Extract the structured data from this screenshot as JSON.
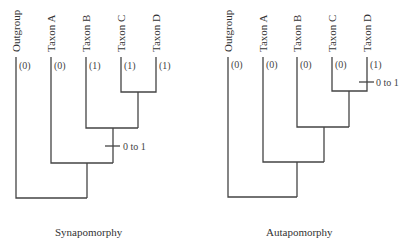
{
  "panels": [
    {
      "caption": "Synapomorphy",
      "taxa": [
        "Outgroup",
        "Taxon A",
        "Taxon B",
        "Taxon C",
        "Taxon D"
      ],
      "states": [
        "(0)",
        "(0)",
        "(1)",
        "(1)",
        "(1)"
      ],
      "change_label": "0 to 1",
      "change_location": "branch leading to clade (Taxon B, Taxon C, Taxon D)"
    },
    {
      "caption": "Autapomorphy",
      "taxa": [
        "Outgroup",
        "Taxon A",
        "Taxon B",
        "Taxon C",
        "Taxon D"
      ],
      "states": [
        "(0)",
        "(0)",
        "(0)",
        "(0)",
        "(1)"
      ],
      "change_label": "0 to 1",
      "change_location": "terminal branch of Taxon D"
    }
  ],
  "colors": {
    "line": "#444444",
    "text": "#333333"
  }
}
